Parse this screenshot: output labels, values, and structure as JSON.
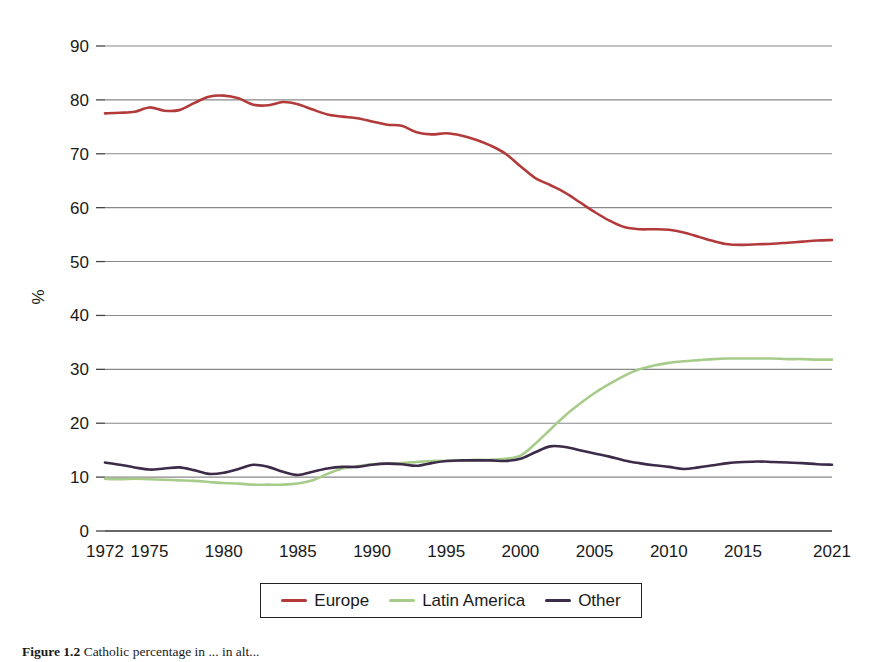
{
  "chart_data": {
    "type": "line",
    "title": "",
    "xlabel": "",
    "ylabel": "%",
    "xlim": [
      1972,
      2021
    ],
    "ylim": [
      0,
      90
    ],
    "grid": true,
    "legend_position": "bottom",
    "x_tick_labels": [
      "1972",
      "1975",
      "1980",
      "1985",
      "1990",
      "1995",
      "2000",
      "2005",
      "2010",
      "2015",
      "2021"
    ],
    "x_tick_values": [
      1972,
      1975,
      1980,
      1985,
      1990,
      1995,
      2000,
      2005,
      2010,
      2015,
      2021
    ],
    "y_tick_labels": [
      "0",
      "10",
      "20",
      "30",
      "40",
      "50",
      "60",
      "70",
      "80",
      "90"
    ],
    "y_tick_values": [
      0,
      10,
      20,
      30,
      40,
      50,
      60,
      70,
      80,
      90
    ],
    "x": [
      1972,
      1973,
      1974,
      1975,
      1976,
      1977,
      1978,
      1979,
      1980,
      1981,
      1982,
      1983,
      1984,
      1985,
      1986,
      1987,
      1988,
      1989,
      1990,
      1991,
      1992,
      1993,
      1994,
      1995,
      1996,
      1997,
      1998,
      1999,
      2000,
      2001,
      2002,
      2003,
      2004,
      2005,
      2006,
      2007,
      2008,
      2009,
      2010,
      2011,
      2012,
      2013,
      2014,
      2015,
      2016,
      2017,
      2018,
      2019,
      2020,
      2021
    ],
    "series": [
      {
        "name": "Europe",
        "color": "#b23a3a",
        "values": [
          77.5,
          77.6,
          77.8,
          78.6,
          78.0,
          78.1,
          79.4,
          80.6,
          80.8,
          80.3,
          79.1,
          79.0,
          79.6,
          79.2,
          78.2,
          77.3,
          76.9,
          76.6,
          76.0,
          75.4,
          75.2,
          74.0,
          73.6,
          73.8,
          73.4,
          72.6,
          71.5,
          70.0,
          67.7,
          65.5,
          64.2,
          62.8,
          61.0,
          59.2,
          57.6,
          56.4,
          56.0,
          56.0,
          55.9,
          55.4,
          54.6,
          53.8,
          53.2,
          53.1,
          53.2,
          53.3,
          53.5,
          53.7,
          53.9,
          54.0
        ]
      },
      {
        "name": "Latin America",
        "color": "#a7cc8a",
        "values": [
          9.7,
          9.6,
          9.7,
          9.6,
          9.5,
          9.4,
          9.3,
          9.1,
          8.9,
          8.8,
          8.6,
          8.6,
          8.6,
          8.8,
          9.4,
          10.6,
          11.6,
          12.0,
          12.4,
          12.5,
          12.6,
          12.8,
          13.0,
          13.0,
          13.1,
          13.2,
          13.2,
          13.4,
          14.0,
          16.2,
          18.8,
          21.4,
          23.6,
          25.6,
          27.3,
          28.8,
          30.0,
          30.7,
          31.2,
          31.5,
          31.7,
          31.9,
          32.0,
          32.0,
          32.0,
          32.0,
          31.9,
          31.9,
          31.8,
          31.8
        ]
      },
      {
        "name": "Other",
        "color": "#3d2b4a",
        "values": [
          12.7,
          12.3,
          11.8,
          11.4,
          11.6,
          11.8,
          11.3,
          10.6,
          10.8,
          11.5,
          12.3,
          11.9,
          11.0,
          10.4,
          11.0,
          11.6,
          11.9,
          11.9,
          12.3,
          12.5,
          12.4,
          12.1,
          12.6,
          13.0,
          13.1,
          13.1,
          13.1,
          13.0,
          13.4,
          14.6,
          15.7,
          15.6,
          15.0,
          14.4,
          13.8,
          13.1,
          12.6,
          12.2,
          11.9,
          11.5,
          11.8,
          12.2,
          12.6,
          12.8,
          12.9,
          12.8,
          12.7,
          12.6,
          12.4,
          12.3
        ]
      }
    ],
    "legend": [
      {
        "label": "Europe",
        "color": "#b23a3a"
      },
      {
        "label": "Latin America",
        "color": "#a7cc8a"
      },
      {
        "label": "Other",
        "color": "#3d2b4a"
      }
    ]
  },
  "caption": {
    "prefix": "Figure 1.2",
    "text": "Catholic percentage in ... in alt..."
  }
}
